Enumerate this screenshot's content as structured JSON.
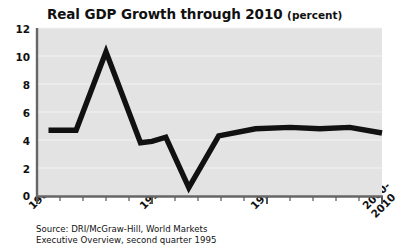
{
  "chart_data": {
    "type": "line",
    "title": "Real GDP Growth through 2010",
    "title_units": "(percent)",
    "xlabel": "",
    "ylabel": "",
    "xlim": [
      1985,
      2000
    ],
    "ylim": [
      0,
      12
    ],
    "yticks": [
      0,
      2,
      4,
      6,
      8,
      10,
      12
    ],
    "ytick_labels": [
      "0",
      "2",
      "4",
      "6",
      "8",
      "10",
      "12"
    ],
    "xticks": [
      1985,
      1990,
      1995,
      2000
    ],
    "xtick_labels": [
      "1985",
      "1990",
      "1995",
      "2000-\n2010"
    ],
    "xtick_label_lines": [
      [
        "1985"
      ],
      [
        "1990"
      ],
      [
        "1995"
      ],
      [
        "2000-",
        "2010"
      ]
    ],
    "minor_xticks_per_major": 5,
    "grid": "horizontal",
    "legend": "none",
    "series": [
      {
        "name": "Real GDP Growth",
        "x": [
          1985.5,
          1986.7,
          1988.0,
          1989.5,
          1990.0,
          1990.6,
          1991.6,
          1992.9,
          1994.5,
          1996.0,
          1997.3,
          1998.6,
          2000.0
        ],
        "values": [
          4.7,
          4.7,
          10.3,
          3.8,
          3.9,
          4.2,
          0.6,
          4.3,
          4.8,
          4.9,
          4.8,
          4.9,
          4.5
        ]
      }
    ],
    "series_color": "#111111",
    "plot_background": "#e3e3e3",
    "grid_color": "#f2f2f2",
    "axis_color": "#555555"
  },
  "source": {
    "line1": "Source: DRI/McGraw-Hill, World Markets",
    "line2": "Executive Overview, second quarter 1995"
  }
}
